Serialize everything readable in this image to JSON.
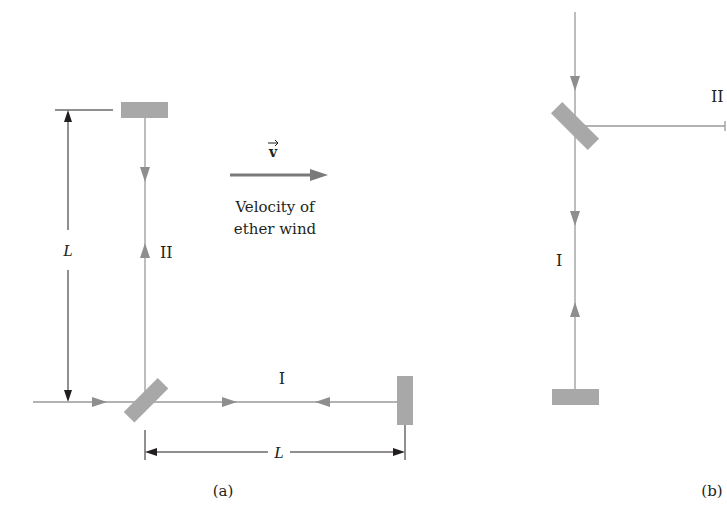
{
  "colors": {
    "beam": "#9a9a9a",
    "mirror": "#a8a8a8",
    "dimension": "#231f20",
    "velocity_arrow": "#7a7a7a",
    "text": "#231f20",
    "background": "#ffffff"
  },
  "panel_a": {
    "caption": "(a)",
    "arm_label_vertical": "II",
    "arm_label_horizontal": "I",
    "dim_vertical_label": "L",
    "dim_horizontal_label": "L",
    "velocity": {
      "symbol": "v",
      "label_line1": "Velocity of",
      "label_line2": "ether wind"
    }
  },
  "panel_b": {
    "caption": "(b)",
    "arm_label_horizontal": "II",
    "arm_label_vertical": "I"
  }
}
